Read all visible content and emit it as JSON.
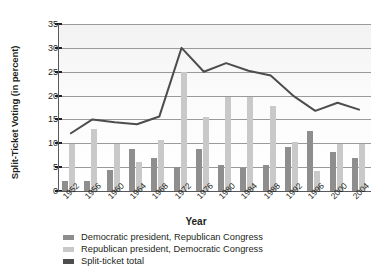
{
  "chart_data": {
    "type": "bar",
    "title": "",
    "xlabel": "Year",
    "ylabel": "Split-Ticket Voting (in percent)",
    "ylim": [
      0,
      35
    ],
    "ytick_step": 5,
    "yticks": [
      "0",
      "5",
      "10",
      "15",
      "20",
      "25",
      "30",
      "35"
    ],
    "grid": true,
    "legend_position": "bottom-left",
    "categories": [
      "1952",
      "1956",
      "1960",
      "1964",
      "1968",
      "1972",
      "1976",
      "1980",
      "1984",
      "1988",
      "1992",
      "1996",
      "2000",
      "2004"
    ],
    "series": [
      {
        "name": "Democratic president, Republican Congress",
        "type": "bar",
        "color": "#8e8e8e",
        "values": [
          2.2,
          2.2,
          4.3,
          8.8,
          6.9,
          5.1,
          8.8,
          5.5,
          4.8,
          5.5,
          9.3,
          12.6,
          8.2,
          6.9
        ]
      },
      {
        "name": "Republican president, Democratic Congress",
        "type": "bar",
        "color": "#c9c9c9",
        "values": [
          9.9,
          13.0,
          9.9,
          6.0,
          10.7,
          25.0,
          15.6,
          19.6,
          19.6,
          17.8,
          10.3,
          4.1,
          9.9,
          9.9
        ]
      },
      {
        "name": "Split-ticket total",
        "type": "line",
        "color": "#4d4d4d",
        "values": [
          12.0,
          15.0,
          14.4,
          14.0,
          15.6,
          30.0,
          25.0,
          26.8,
          25.2,
          24.2,
          20.0,
          16.8,
          18.5,
          17.0
        ]
      }
    ]
  },
  "legend": {
    "items": [
      {
        "label": "Democratic president, Republican Congress",
        "color": "#8e8e8e"
      },
      {
        "label": "Republican president, Democratic Congress",
        "color": "#c9c9c9"
      },
      {
        "label": "Split-ticket total",
        "color": "#4d4d4d"
      }
    ]
  }
}
